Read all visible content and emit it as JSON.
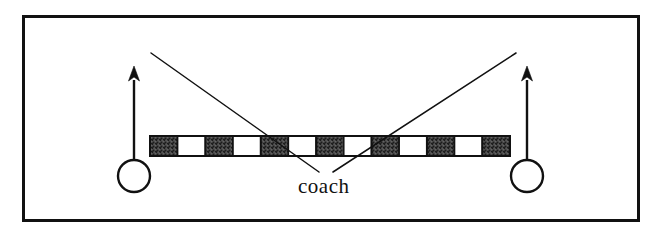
{
  "figure": {
    "name": "coach-sightline-diagram",
    "background_color": "#ffffff",
    "ink_color": "#111111",
    "width": 662,
    "height": 238
  },
  "frame": {
    "name": "outer-border",
    "x": 22,
    "y": 15,
    "width": 618,
    "height": 207,
    "stroke_width": 3,
    "color": "#111111"
  },
  "bar": {
    "name": "segmented-bar",
    "x": 150,
    "y": 136,
    "width": 360,
    "height": 20,
    "segment_count": 13,
    "dark_segment_count": 7,
    "light_segment_count": 6,
    "pattern": [
      "dark",
      "light",
      "dark",
      "light",
      "dark",
      "light",
      "dark",
      "light",
      "dark",
      "light",
      "dark",
      "light",
      "dark"
    ],
    "dark_fill": "#555555",
    "light_fill": "#ffffff",
    "stroke": "#111111",
    "stroke_width": 2
  },
  "players": [
    {
      "name": "player-left",
      "circle_cx": 134,
      "circle_cy": 176,
      "circle_r": 16,
      "arrow_x": 134,
      "arrow_tail_y": 160,
      "arrow_tip_y": 66
    },
    {
      "name": "player-right",
      "circle_cx": 527,
      "circle_cy": 176,
      "circle_r": 16,
      "arrow_x": 527,
      "arrow_tail_y": 160,
      "arrow_tip_y": 66
    }
  ],
  "sightlines": [
    {
      "name": "sightline-left",
      "x1": 151,
      "y1": 53,
      "x2": 319,
      "y2": 172
    },
    {
      "name": "sightline-right",
      "x1": 516,
      "y1": 53,
      "x2": 333,
      "y2": 172
    }
  ],
  "labels": {
    "coach": {
      "text": "coach",
      "x": 298,
      "y": 176,
      "font_size": 21
    }
  }
}
